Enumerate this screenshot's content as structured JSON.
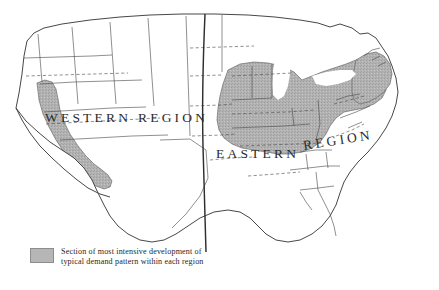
{
  "figure": {
    "type": "thematic-map",
    "background_color": "#ffffff",
    "line_color": "#3a3a3a",
    "shade_color": "#b0b0b0"
  },
  "labels": {
    "western_region": "WESTERN  REGION",
    "western_region_part1": "WESTERN",
    "western_region_part2": "REGION",
    "eastern_region_part1": "EASTERN",
    "eastern_region_part2": "REGION"
  },
  "legend": {
    "swatch_color": "#b6b6b6",
    "line1": "Section of most intensive development of",
    "line2": "typical demand pattern within each region"
  },
  "regions": [
    {
      "name": "Western Region",
      "shaded_area": "California and western Nevada"
    },
    {
      "name": "Eastern Region",
      "shaded_area": "Midwest through Mid-Atlantic and Northeast"
    }
  ]
}
